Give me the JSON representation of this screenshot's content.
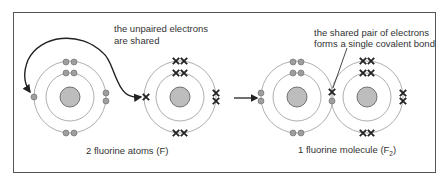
{
  "annotations": {
    "unpaired_line1": "the unpaired electrons",
    "unpaired_line2": "are shared",
    "shared_line1": "the shared pair of electrons",
    "shared_line2": "forms a single covalent bond"
  },
  "captions": {
    "atoms": "2 fluorine atoms (F)",
    "molecule_prefix": "1 fluorine molecule (F",
    "molecule_subscript": "2",
    "molecule_suffix": ")"
  },
  "atoms": [
    {
      "id": "atom-1",
      "symbol": "F",
      "electron_marker": "dot"
    },
    {
      "id": "atom-2",
      "symbol": "F",
      "electron_marker": "cross"
    },
    {
      "id": "molecule-atom-left",
      "symbol": "F",
      "electron_marker": "dot"
    },
    {
      "id": "molecule-atom-right",
      "symbol": "F",
      "electron_marker": "cross"
    }
  ],
  "colors": {
    "border": "#555555",
    "ring": "#999999",
    "nucleus_fill": "#bdbdbd",
    "nucleus_stroke": "#555555",
    "dot_fill": "#9e9e9e",
    "cross": "#222222",
    "text": "#333333"
  }
}
